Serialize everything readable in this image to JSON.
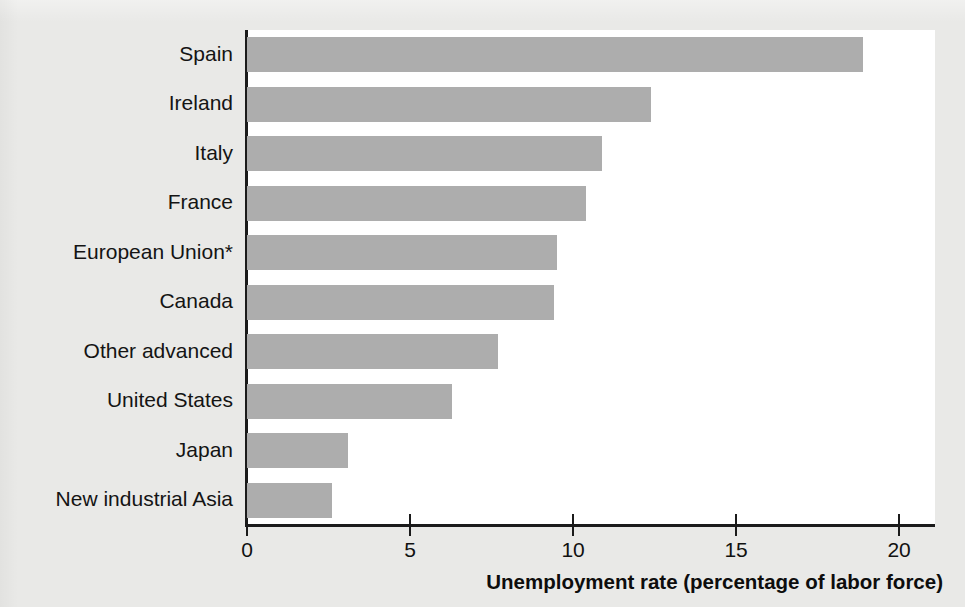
{
  "chart_data": {
    "type": "bar",
    "orientation": "horizontal",
    "title": "",
    "subtitle": "",
    "xlabel": "Unemployment rate (percentage of labor force)",
    "ylabel": "",
    "xlim": [
      0,
      21.1
    ],
    "xticks": [
      0,
      5,
      10,
      15,
      20
    ],
    "xtick_labels": [
      "0",
      "5",
      "10",
      "15",
      "20"
    ],
    "grid": false,
    "legend": "none",
    "categories": [
      "Spain",
      "Ireland",
      "Italy",
      "France",
      "European Union*",
      "Canada",
      "Other advanced",
      "United States",
      "Japan",
      "New industrial Asia"
    ],
    "values": [
      18.9,
      12.4,
      10.9,
      10.4,
      9.5,
      9.4,
      7.7,
      6.3,
      3.1,
      2.6
    ],
    "bar_color": "#adadad",
    "axis_color": "#1b1b1b",
    "plot_background": "#ffffff",
    "figure_background": "#e9e9e7",
    "footnote_marker": "*"
  },
  "axis": {
    "x_title": "Unemployment rate (percentage of labor force)"
  }
}
